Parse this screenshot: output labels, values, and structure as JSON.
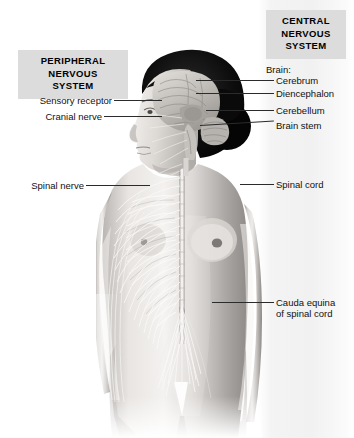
{
  "diagram": {
    "title_cns": "CENTRAL\nNERVOUS\nSYSTEM",
    "title_pns": "PERIPHERAL\nNERVOUS\nSYSTEM",
    "cns_line1": "CENTRAL",
    "cns_line2": "NERVOUS",
    "cns_line3": "SYSTEM",
    "pns_line1": "PERIPHERAL",
    "pns_line2": "NERVOUS",
    "pns_line3": "SYSTEM",
    "colors": {
      "header_box_fill": "#dcdcdc",
      "text": "#111111",
      "leader_line": "#2b2b2b",
      "hair": "#0a0a0a",
      "skin_light": "#f2f0ee",
      "skin_mid": "#c9c6c3",
      "skin_shadow": "#8d8a88",
      "nerve": "#f4f3f1",
      "brain_mid": "#b9b5b1"
    }
  },
  "labels_right": [
    {
      "id": "brain-group",
      "text": "Brain:",
      "x": 266,
      "y": 64,
      "has_leader": false
    },
    {
      "id": "cerebrum",
      "text": "Cerebrum",
      "x": 276,
      "y": 75,
      "has_leader": true
    },
    {
      "id": "diencephalon",
      "text": "Diencephalon",
      "x": 276,
      "y": 88,
      "has_leader": true
    },
    {
      "id": "cerebellum",
      "text": "Cerebellum",
      "x": 276,
      "y": 105,
      "has_leader": true
    },
    {
      "id": "brain-stem",
      "text": "Brain stem",
      "x": 276,
      "y": 120,
      "has_leader": true
    },
    {
      "id": "spinal-cord",
      "text": "Spinal cord",
      "x": 276,
      "y": 179,
      "has_leader": true
    },
    {
      "id": "cauda-equina-1",
      "text": "Cauda equina",
      "x": 276,
      "y": 297,
      "has_leader": true
    },
    {
      "id": "cauda-equina-2",
      "text": "of spinal cord",
      "x": 276,
      "y": 308,
      "has_leader": false
    }
  ],
  "labels_left": [
    {
      "id": "sensory-receptor",
      "text": "Sensory receptor",
      "x": 18,
      "y": 95,
      "has_leader": true
    },
    {
      "id": "cranial-nerve",
      "text": "Cranial nerve",
      "x": 18,
      "y": 111,
      "has_leader": true
    },
    {
      "id": "spinal-nerve",
      "text": "Spinal nerve",
      "x": 18,
      "y": 180,
      "has_leader": true
    }
  ]
}
